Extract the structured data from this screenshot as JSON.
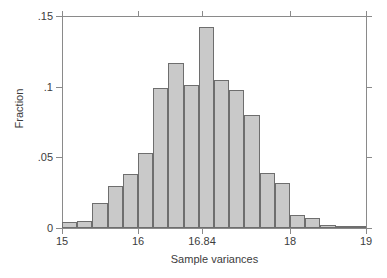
{
  "chart_data": {
    "type": "bar",
    "title": "",
    "subtitle": "",
    "xlabel": "Sample variances",
    "ylabel": "Fraction",
    "xlim": [
      15,
      19
    ],
    "ylim": [
      0,
      0.15
    ],
    "grid": false,
    "legend": false,
    "bar_style": {
      "fill": "#c9c9c9",
      "outline": "#6e6e6e"
    },
    "axis_color": "#8a8a8a",
    "x_tick_labels": [
      "15",
      "16",
      "16.84",
      "18",
      "19"
    ],
    "x_tick_values": [
      15,
      16,
      16.84,
      18,
      19
    ],
    "y_tick_labels": [
      "0",
      ".05",
      ".1",
      ".15"
    ],
    "y_tick_values": [
      0,
      0.05,
      0.1,
      0.15
    ],
    "bin_width": 0.2,
    "categories": [
      "15.0-15.2",
      "15.2-15.4",
      "15.4-15.6",
      "15.6-15.8",
      "15.8-16.0",
      "16.0-16.2",
      "16.2-16.4",
      "16.4-16.6",
      "16.6-16.8",
      "16.8-17.0",
      "17.0-17.2",
      "17.2-17.4",
      "17.4-17.6",
      "17.6-17.8",
      "17.8-18.0",
      "18.0-18.2",
      "18.2-18.4",
      "18.4-18.6",
      "18.6-18.8",
      "18.8-19.0"
    ],
    "bin_centers": [
      15.1,
      15.3,
      15.5,
      15.7,
      15.9,
      16.1,
      16.3,
      16.5,
      16.7,
      16.9,
      17.1,
      17.3,
      17.5,
      17.7,
      17.9,
      18.1,
      18.3,
      18.5,
      18.7,
      18.9
    ],
    "values": [
      0.004,
      0.005,
      0.018,
      0.03,
      0.038,
      0.053,
      0.099,
      0.117,
      0.101,
      0.142,
      0.105,
      0.098,
      0.08,
      0.039,
      0.032,
      0.009,
      0.007,
      0.002,
      0.0,
      0.0
    ]
  }
}
